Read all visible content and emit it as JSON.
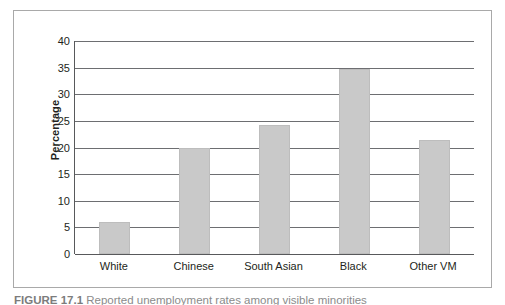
{
  "figure": {
    "caption_label": "FIGURE 17.1",
    "caption_text": "Reported unemployment rates among visible minorities"
  },
  "chart_data": {
    "type": "bar",
    "title": "",
    "xlabel": "",
    "ylabel": "Percentage",
    "categories": [
      "White",
      "Chinese",
      "South Asian",
      "Black",
      "Other VM"
    ],
    "values": [
      6.0,
      20.0,
      24.3,
      34.8,
      21.5
    ],
    "ylim": [
      0,
      40
    ],
    "ytick_labels": [
      "0",
      "5",
      "10",
      "15",
      "20",
      "25",
      "30",
      "35",
      "40"
    ],
    "ytick_values": [
      0,
      5,
      10,
      15,
      20,
      25,
      30,
      35,
      40
    ],
    "grid": true,
    "legend": "none",
    "bar_color": "#c9c9c9",
    "axis_color": "#58595b",
    "gridline_color": "#6d6e71",
    "frame_color": "#a9a9a9",
    "background": "#ffffff"
  }
}
